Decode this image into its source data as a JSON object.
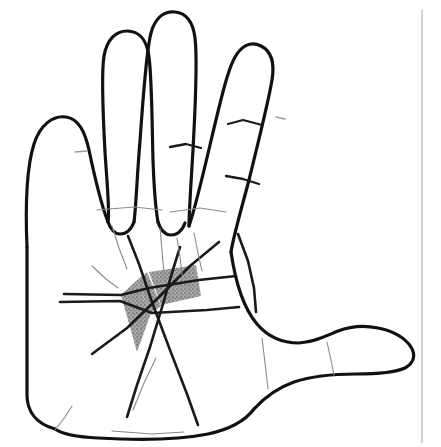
{
  "figure": {
    "caption": "Line drawing of an open left hand, palm facing the viewer, with a stippled grey triangular zone bounded by the proximal palmar crease, the distal palmar crease and an oblique crease in the mid-palm.",
    "view": "palmar",
    "handedness": "left"
  },
  "canvas": {
    "width": 441,
    "height": 447,
    "background_color": "#ffffff"
  },
  "style": {
    "outline_color": "#111111",
    "outline_width": 3.2,
    "crease_color": "#1a1a1a",
    "crease_width": 2.6,
    "faint_crease_color": "#8a8a8a",
    "faint_crease_width": 1.1,
    "shade_fill_color": "#a3a3a3",
    "shade_stipple_color": "#4a4a4a",
    "margin_rule_color": "#b4b4b4",
    "margin_rule_width": 1.2
  },
  "labels": {
    "digits": [
      {
        "name": "thumb",
        "data_name": "digit-thumb",
        "position": "right-lateral"
      },
      {
        "name": "index-finger",
        "data_name": "digit-index",
        "position": "far-left"
      },
      {
        "name": "middle-finger",
        "data_name": "digit-middle",
        "position": "left-center"
      },
      {
        "name": "ring-finger",
        "data_name": "digit-ring",
        "position": "center"
      },
      {
        "name": "little-finger",
        "data_name": "digit-little",
        "position": "right"
      }
    ],
    "creases": [
      {
        "name": "distal-palmar-crease",
        "data_name": "crease-distal-palmar"
      },
      {
        "name": "proximal-palmar-crease",
        "data_name": "crease-proximal-palmar"
      },
      {
        "name": "oblique-mid-palmar-crease",
        "data_name": "crease-oblique-mid-palmar"
      },
      {
        "name": "thenar-crease",
        "data_name": "crease-thenar"
      },
      {
        "name": "wrist-crease",
        "data_name": "crease-wrist"
      }
    ],
    "shaded_region": {
      "name": "shaded-triangular-zone",
      "description": "Stippled grey triangle in the mid-palm",
      "segments": 3
    }
  },
  "geometry": {
    "hand_outline_path": "M 27 247 C 25 200 27 166 34 144 C 40 125 53 115 66 117 C 79 119 85 132 89 150 C 94 174 101 204 108 222 C 110 213 107 183 105 152 C 103 115 101 74 104 56 C 107 39 116 31 127 31 C 139 31 147 40 149 57 C 152 80 152 126 153 160 C 154 188 156 211 158 222 C 161 208 163 176 166 141 C 169 100 172 51 177 33 C 181 18 190 11 201 12 C 212 13 219 22 221 38 C 224 62 221 110 219 150 C 217 184 215 212 215 226 C 220 212 228 179 236 145 C 245 107 253 72 260 59 C 267 45 277 41 287 46 C 297 51 301 62 298 80 C 294 104 283 147 275 180 C 266 214 259 238 257 252 L 257 265 C 262 286 269 306 277 320 C 284 333 292 341 303 345 C 315 349 327 347 338 341 C 350 334 360 329 373 329 C 387 329 400 335 409 344 C 417 352 419 361 414 368 C 408 376 394 379 376 380 C 356 381 333 380 314 383 C 295 386 280 393 270 404 C 262 413 255 422 243 429 C 231 436 214 439 193 438 C 165 437 136 436 112 435 C 93 434 80 432 74 429 L 74 247 Z",
    "shaded_polygons": [
      "M 121 295 L 136 281 L 151 313 L 137 352 Z",
      "M 136 281 L 146 273 L 160 307 L 151 313 Z",
      "M 149 272 L 196 266 L 200 296 L 160 305 Z"
    ],
    "creases_paths": [
      "M 64 294 L 122 294 L 148 289 L 196 282 L 237 279",
      "M 60 301 L 120 300 L 152 313 L 205 311 L 239 309",
      "M 94 352 L 128 327 L 156 299 L 188 268 L 216 245",
      "M 129 237 L 139 263 L 152 300 L 170 349 L 186 393 L 197 424",
      "M 179 248 L 172 272 L 163 303 L 151 345 L 138 383 L 128 416",
      "M 238 236 L 248 260 L 254 287 L 256 311",
      "M 75 429 L 115 433 L 165 436 L 215 434 L 256 425 L 289 408"
    ],
    "faint_creases_paths": [
      "M 110 224 L 118 247 L 126 268",
      "M 160 226 L 162 250 L 164 272",
      "M 177 236 L 180 256 L 182 274",
      "M 193 232 L 198 252 L 202 270",
      "M 92 265 L 106 278 L 118 287",
      "M 96 209 L 134 207 L 168 209",
      "M 168 212 L 200 209 L 224 212",
      "M 155 357 L 143 382 L 132 409",
      "M 262 336 L 265 362 L 268 388",
      "M 327 340 L 331 360 L 334 374",
      "M 114 430 L 150 433 L 182 432"
    ],
    "finger_creases_paths": [
      "M 170 146 L 186 144 L 201 147",
      "M 227 124 L 243 120 L 262 124",
      "M 226 175 L 243 178 L 259 183",
      "M 75 151 L 86 150",
      "M 276 116 L 284 118"
    ],
    "margin_rule": {
      "x": 422,
      "y1": 10,
      "y2": 443
    }
  }
}
